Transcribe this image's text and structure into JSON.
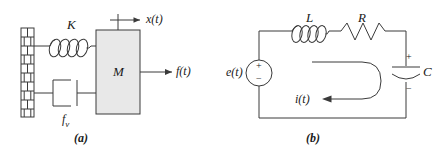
{
  "figure": {
    "width": 439,
    "height": 158,
    "background": "#ffffff",
    "stroke_color": "#3a3a3a",
    "mass_fill": "#e8e8e8",
    "panels": [
      {
        "key": "a",
        "caption": "(a)",
        "title": "mass-spring-damper mechanical system"
      },
      {
        "key": "b",
        "caption": "(b)",
        "title": "series RLC electrical circuit"
      }
    ]
  },
  "mechanical": {
    "caption": "(a)",
    "spring_label": "K",
    "mass_label": "M",
    "damper_label": "f",
    "damper_label_sub": "v",
    "displacement_label": "x(t)",
    "force_label": "f(t)",
    "wall_name": "fixed-wall",
    "spring_coils": 4,
    "mass_fill_color": "#e8e8e8"
  },
  "electrical": {
    "caption": "(b)",
    "source_label": "e(t)",
    "source_plus": "+",
    "source_minus": "−",
    "inductor_label": "L",
    "resistor_label": "R",
    "capacitor_label": "C",
    "capacitor_plus": "+",
    "capacitor_minus": "−",
    "current_label": "i(t)",
    "inductor_coils": 4,
    "resistor_peaks": 3
  }
}
